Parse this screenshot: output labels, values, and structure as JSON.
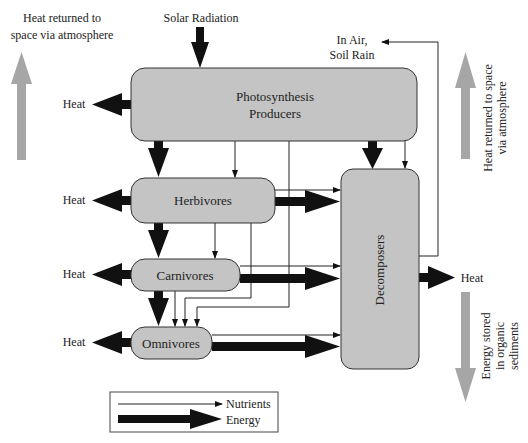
{
  "diagram": {
    "inputs": {
      "solar": "Solar Radiation",
      "in_air_line1": "In Air,",
      "in_air_line2": "Soil Rain"
    },
    "nodes": {
      "producers_line1": "Photosynthesis",
      "producers_line2": "Producers",
      "herbivores": "Herbivores",
      "carnivores": "Carnivores",
      "omnivores": "Omnivores",
      "decomposers": "Decomposers"
    },
    "heat": {
      "producers": "Heat",
      "herbivores": "Heat",
      "carnivores": "Heat",
      "omnivores": "Heat",
      "decomposers": "Heat"
    },
    "side_notes": {
      "left_line1": "Heat returned to",
      "left_line2": "space via atmosphere",
      "right_line1": "Heat returned to space",
      "right_line2": "via atmosphere",
      "bottom_line1": "Energy stored",
      "bottom_line2": "in organic",
      "bottom_line3": "sediments"
    },
    "legend": {
      "nutrients": "Nutrients",
      "energy": "Energy"
    },
    "colors": {
      "box_fill": "#c4c4c4",
      "arrow_energy": "#111111",
      "arrow_side": "#a6a6a6",
      "line": "#222222"
    }
  }
}
